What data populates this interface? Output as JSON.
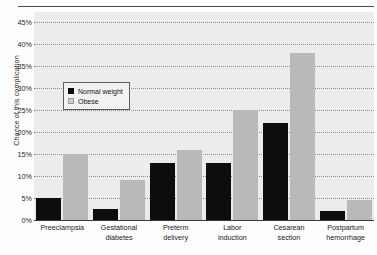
{
  "figure": {
    "top_clipped_caption": "",
    "background_color": "#ececec",
    "axis_color": "#3a3a3a"
  },
  "legend": {
    "position": "inside-top-left",
    "items": [
      {
        "label": "Normal weight",
        "color": "#0d0d0d",
        "swatch": "normal-weight-swatch"
      },
      {
        "label": "Obese",
        "color": "#b9b9b9",
        "swatch": "obese-swatch"
      }
    ]
  },
  "chart_data": {
    "type": "bar",
    "title": "",
    "xlabel": "",
    "ylabel": "Chance of this complication",
    "ylim": [
      0,
      45
    ],
    "ytick_step": 5,
    "yticks": [
      "0%",
      "5%",
      "10%",
      "15%",
      "20%",
      "25%",
      "30%",
      "35%",
      "40%",
      "45%"
    ],
    "ytick_values": [
      0,
      5,
      10,
      15,
      20,
      25,
      30,
      35,
      40,
      45
    ],
    "grid": "horizontal-dotted",
    "categories": [
      "Preeclampsia",
      "Gestational diabetes",
      "Preterm delivery",
      "Labor induction",
      "Cesarean section",
      "Postpartum hemorrhage"
    ],
    "category_lines": [
      [
        "Preeclampsia"
      ],
      [
        "Gestational",
        "diabetes"
      ],
      [
        "Preterm",
        "delivery"
      ],
      [
        "Labor",
        "induction"
      ],
      [
        "Cesarean",
        "section"
      ],
      [
        "Postpartum",
        "hemorrhage"
      ]
    ],
    "series": [
      {
        "name": "Normal weight",
        "color": "#0d0d0d",
        "values": [
          5,
          2.5,
          13,
          13,
          22,
          2
        ]
      },
      {
        "name": "Obese",
        "color": "#b9b9b9",
        "values": [
          15,
          9,
          16,
          25,
          38,
          4.5
        ]
      }
    ]
  }
}
